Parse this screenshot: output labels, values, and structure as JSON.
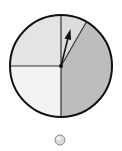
{
  "diagram": {
    "type": "spinner",
    "sectors": [
      {
        "name": "top-left-quarter",
        "fraction": 0.25,
        "color": "#e4e4e4"
      },
      {
        "name": "bottom-left-quarter",
        "fraction": 0.25,
        "color": "#f3f3f3"
      },
      {
        "name": "top-right-wedge",
        "fraction": 0.083,
        "color": "#dcdcdc"
      },
      {
        "name": "right-large-sector",
        "fraction": 0.417,
        "color": "#bdbdbd"
      }
    ],
    "pointer": {
      "direction": "up-right",
      "color": "#111111"
    },
    "outline_color": "#111111",
    "marker": {
      "shape": "circle",
      "color": "#d8d8d8"
    }
  }
}
